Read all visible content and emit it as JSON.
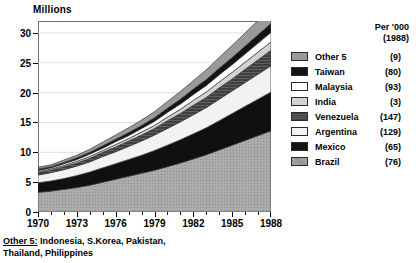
{
  "axes": {
    "y_title": "Millions",
    "y_ticks": [
      0,
      5,
      10,
      15,
      20,
      25,
      30
    ],
    "x_ticks": [
      "1970",
      "1973",
      "1976",
      "1979",
      "1982",
      "1985",
      "1988"
    ]
  },
  "legend": {
    "header_line1": "Per '000",
    "header_line2": "(1988)",
    "entries": [
      {
        "label": "Other 5",
        "value": "(9)",
        "fill": "midgray"
      },
      {
        "label": "Taiwan",
        "value": "(80)",
        "fill": "black"
      },
      {
        "label": "Malaysia",
        "value": "(93)",
        "fill": "white"
      },
      {
        "label": "India",
        "value": "(3)",
        "fill": "lightgray"
      },
      {
        "label": "Venezuela",
        "value": "(147)",
        "fill": "darkgray"
      },
      {
        "label": "Argentina",
        "value": "(129)",
        "fill": "paleblue"
      },
      {
        "label": "Mexico",
        "value": "(65)",
        "fill": "black"
      },
      {
        "label": "Brazil",
        "value": "(76)",
        "fill": "stipple"
      }
    ]
  },
  "footnote": {
    "key": "Other 5:",
    "text": " Indonesia, S.Korea, Pakistan,",
    "line2": "Thailand, Philippines"
  },
  "chart_data": {
    "type": "area",
    "title": "",
    "subtitle": "",
    "xlabel": "",
    "ylabel": "Millions",
    "xlim": [
      1970,
      1988
    ],
    "ylim": [
      0,
      32
    ],
    "grid": true,
    "stacked": true,
    "legend_position": "right",
    "x": [
      1970,
      1971,
      1972,
      1973,
      1974,
      1975,
      1976,
      1977,
      1978,
      1979,
      1980,
      1981,
      1982,
      1983,
      1984,
      1985,
      1986,
      1987,
      1988
    ],
    "series": [
      {
        "name": "Brazil",
        "color": "#a8a8a8",
        "values": [
          3.3,
          3.5,
          3.8,
          4.1,
          4.5,
          5.0,
          5.5,
          6.0,
          6.5,
          7.0,
          7.6,
          8.2,
          8.9,
          9.6,
          10.4,
          11.2,
          12.0,
          12.8,
          13.6
        ]
      },
      {
        "name": "Mexico",
        "color": "#101010",
        "values": [
          1.6,
          1.7,
          1.8,
          2.0,
          2.2,
          2.4,
          2.6,
          2.8,
          3.0,
          3.3,
          3.6,
          3.9,
          4.2,
          4.5,
          4.9,
          5.3,
          5.7,
          6.1,
          6.5
        ]
      },
      {
        "name": "Argentina",
        "color": "#f2f2f2",
        "values": [
          1.3,
          1.4,
          1.5,
          1.6,
          1.7,
          1.9,
          2.0,
          2.2,
          2.4,
          2.6,
          2.8,
          3.0,
          3.2,
          3.4,
          3.6,
          3.8,
          4.0,
          4.2,
          4.4
        ]
      },
      {
        "name": "Venezuela",
        "color": "#4a4a4a",
        "values": [
          0.4,
          0.4,
          0.5,
          0.5,
          0.6,
          0.7,
          0.8,
          0.9,
          1.0,
          1.1,
          1.3,
          1.4,
          1.6,
          1.7,
          1.9,
          2.0,
          2.2,
          2.4,
          2.6
        ]
      },
      {
        "name": "India",
        "color": "#d2d2d2",
        "values": [
          0.2,
          0.2,
          0.2,
          0.3,
          0.3,
          0.3,
          0.4,
          0.4,
          0.5,
          0.5,
          0.6,
          0.7,
          0.8,
          0.9,
          1.0,
          1.1,
          1.2,
          1.3,
          1.4
        ]
      },
      {
        "name": "Malaysia",
        "color": "#ffffff",
        "values": [
          0.2,
          0.2,
          0.3,
          0.3,
          0.4,
          0.4,
          0.5,
          0.5,
          0.6,
          0.7,
          0.8,
          0.9,
          1.0,
          1.1,
          1.2,
          1.3,
          1.4,
          1.5,
          1.6
        ]
      },
      {
        "name": "Taiwan",
        "color": "#141414",
        "values": [
          0.2,
          0.2,
          0.2,
          0.3,
          0.3,
          0.4,
          0.4,
          0.5,
          0.5,
          0.6,
          0.7,
          0.8,
          0.9,
          1.0,
          1.1,
          1.2,
          1.3,
          1.4,
          1.5
        ]
      },
      {
        "name": "Other 5",
        "color": "#9a9a9a",
        "values": [
          0.3,
          0.3,
          0.4,
          0.4,
          0.5,
          0.6,
          0.7,
          0.8,
          0.9,
          1.0,
          1.1,
          1.3,
          1.4,
          1.6,
          1.8,
          2.0,
          2.2,
          2.4,
          2.6
        ]
      }
    ],
    "totals": [
      7.5,
      7.9,
      8.7,
      9.5,
      10.5,
      11.7,
      12.9,
      14.1,
      15.4,
      16.8,
      18.5,
      20.2,
      22.0,
      23.8,
      25.9,
      27.9,
      30.0,
      32.1,
      34.2
    ]
  }
}
